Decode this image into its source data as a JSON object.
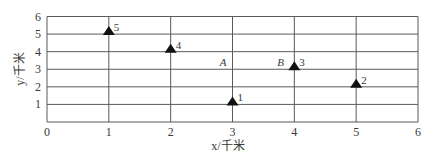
{
  "chart_data": {
    "type": "scatter",
    "title": "",
    "xlabel": "x/千米",
    "ylabel": "y/千米",
    "xlim": [
      0,
      6
    ],
    "ylim": [
      0,
      6
    ],
    "grid": true,
    "x_ticks": [
      "0",
      "1",
      "2",
      "3",
      "4",
      "5",
      "6"
    ],
    "y_ticks": [
      "1",
      "2",
      "3",
      "4",
      "5",
      "6"
    ],
    "marker": "triangle",
    "series": [
      {
        "name": "points",
        "points": [
          {
            "label": "1",
            "x": 3,
            "y": 1
          },
          {
            "label": "2",
            "x": 5,
            "y": 2
          },
          {
            "label": "3",
            "x": 4,
            "y": 3
          },
          {
            "label": "4",
            "x": 2,
            "y": 4
          },
          {
            "label": "5",
            "x": 1,
            "y": 5
          }
        ]
      }
    ],
    "annotations": [
      {
        "text": "A",
        "x": 2.85,
        "y": 3.4
      },
      {
        "text": "B",
        "x": 3.78,
        "y": 3.4
      }
    ],
    "legend": null
  },
  "colors": {
    "grid": "#5a5a5a",
    "marker": "#111111",
    "text": "#3a3a3a"
  }
}
